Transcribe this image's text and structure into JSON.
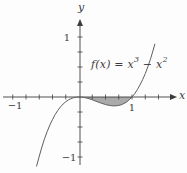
{
  "figure_labels": {
    "x_axis_letter": "x",
    "y_axis_letter": "y",
    "x_tick_pos": "1",
    "x_tick_neg": "−1",
    "y_tick_pos": "1",
    "y_tick_neg": "−1",
    "equation_prefix": "f(x) = x",
    "equation_sup1": "3",
    "equation_mid": " − x",
    "equation_sup2": "2"
  },
  "colors": {
    "axis": "#3c3c3c",
    "curve": "#5f5f5f",
    "shade_fill": "#aaaaaa",
    "background": "#fdfdfd"
  },
  "chart_data": {
    "type": "line",
    "title": "",
    "function_label": "f(x) = x^3 - x^2",
    "xlabel": "x",
    "ylabel": "y",
    "xlim": [
      -1.45,
      1.9
    ],
    "ylim": [
      -1.3,
      1.3
    ],
    "x_tick_step": 0.25,
    "y_tick_step": 0.25,
    "x_labeled_ticks": [
      -1,
      1
    ],
    "y_labeled_ticks": [
      -1,
      1
    ],
    "x_ticks": [
      -1.25,
      -1,
      -0.75,
      -0.5,
      -0.25,
      0.25,
      0.5,
      0.75,
      1,
      1.25,
      1.5
    ],
    "y_ticks": [
      -1,
      -0.75,
      -0.5,
      -0.25,
      0.25,
      0.5,
      0.75,
      1
    ],
    "shaded_region": {
      "x_from": 0,
      "x_to": 1,
      "between": "curve and x-axis"
    },
    "samples": [
      [
        -0.8,
        -1.152
      ],
      [
        -0.75,
        -0.9844
      ],
      [
        -0.7,
        -0.833
      ],
      [
        -0.65,
        -0.6971
      ],
      [
        -0.6,
        -0.576
      ],
      [
        -0.55,
        -0.4689
      ],
      [
        -0.5,
        -0.375
      ],
      [
        -0.45,
        -0.2936
      ],
      [
        -0.4,
        -0.224
      ],
      [
        -0.35,
        -0.1654
      ],
      [
        -0.3,
        -0.117
      ],
      [
        -0.25,
        -0.0781
      ],
      [
        -0.2,
        -0.048
      ],
      [
        -0.15,
        -0.0259
      ],
      [
        -0.1,
        -0.011
      ],
      [
        -0.05,
        -0.0026
      ],
      [
        0.0,
        0.0
      ],
      [
        0.05,
        -0.0024
      ],
      [
        0.1,
        -0.009
      ],
      [
        0.15,
        -0.0191
      ],
      [
        0.2,
        -0.032
      ],
      [
        0.25,
        -0.0469
      ],
      [
        0.3,
        -0.063
      ],
      [
        0.35,
        -0.0796
      ],
      [
        0.4,
        -0.096
      ],
      [
        0.45,
        -0.1114
      ],
      [
        0.5,
        -0.125
      ],
      [
        0.55,
        -0.1361
      ],
      [
        0.6,
        -0.144
      ],
      [
        0.65,
        -0.1479
      ],
      [
        0.7,
        -0.147
      ],
      [
        0.75,
        -0.1406
      ],
      [
        0.8,
        -0.128
      ],
      [
        0.85,
        -0.1084
      ],
      [
        0.9,
        -0.081
      ],
      [
        0.95,
        -0.0451
      ],
      [
        1.0,
        0.0
      ],
      [
        1.05,
        0.0551
      ],
      [
        1.1,
        0.121
      ],
      [
        1.15,
        0.1984
      ],
      [
        1.2,
        0.288
      ],
      [
        1.25,
        0.3906
      ],
      [
        1.3,
        0.507
      ],
      [
        1.35,
        0.6379
      ],
      [
        1.4,
        0.784
      ],
      [
        1.43,
        0.8792
      ]
    ]
  }
}
